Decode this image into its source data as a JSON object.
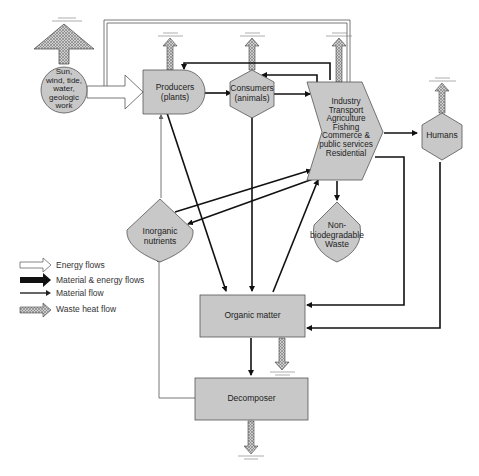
{
  "diagram": {
    "nodes": {
      "sun": {
        "label": "Sun, wind, tide, water, geologic work",
        "lines": [
          "Sun,",
          "wind, tide,",
          "water,",
          "geologic",
          "work"
        ]
      },
      "producers": {
        "label": "Producers (plants)",
        "lines": [
          "Producers",
          "(plants)"
        ]
      },
      "consumers": {
        "label": "Consumers (animals)",
        "lines": [
          "Consumers",
          "(animals)"
        ]
      },
      "industry": {
        "label": "Industry Transport Agriculture Fishing Commerce & public services Residential",
        "lines": [
          "Industry",
          "Transport",
          "Agriculture",
          "Fishing",
          "Commerce &",
          "public services",
          "Residential"
        ]
      },
      "humans": {
        "label": "Humans"
      },
      "inorganic": {
        "label": "Inorganic nutrients",
        "lines": [
          "Inorganic",
          "nutrients"
        ]
      },
      "waste": {
        "label": "Non-biodegradable Waste",
        "lines": [
          "Non-",
          "biodegradable",
          "Waste"
        ]
      },
      "organic": {
        "label": "Organic matter"
      },
      "decomposer": {
        "label": "Decomposer"
      }
    },
    "legend": [
      {
        "type": "energy",
        "label": "Energy flows"
      },
      {
        "type": "material-energy",
        "label": "Material & energy flows"
      },
      {
        "type": "material",
        "label": "Material flow"
      },
      {
        "type": "waste-heat",
        "label": "Waste heat flow"
      }
    ],
    "colors": {
      "node_fill": "#c8c8c8",
      "node_stroke": "#555555",
      "arrow_black": "#111111",
      "arrow_material": "#666666",
      "heat_fill": "#a9a9a9"
    }
  }
}
